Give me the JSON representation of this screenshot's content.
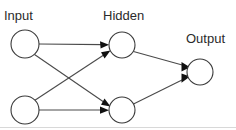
{
  "diagram": {
    "type": "neural-network",
    "title_present": false,
    "background_color": "#ffffff",
    "node_stroke_color": "#3a3a3a",
    "node_fill_color": "#ffffff",
    "edge_color": "#4a4a4a",
    "arrow_color": "#111111",
    "label_color": "#2b2b2b",
    "bottom_rule_color": "#d8d8d8",
    "labels": {
      "input": "Input",
      "hidden": "Hidden",
      "output": "Output"
    },
    "label_positions": {
      "input": {
        "x": 4,
        "y": 20
      },
      "hidden": {
        "x": 103,
        "y": 20
      },
      "output": {
        "x": 186,
        "y": 43
      }
    },
    "layers": [
      {
        "name": "input",
        "label": "Input",
        "node_count": 2,
        "nodes": [
          {
            "id": "i1",
            "cx": 25,
            "cy": 44,
            "r": 14
          },
          {
            "id": "i2",
            "cx": 25,
            "cy": 110,
            "r": 14
          }
        ]
      },
      {
        "name": "hidden",
        "label": "Hidden",
        "node_count": 2,
        "nodes": [
          {
            "id": "h1",
            "cx": 122,
            "cy": 45,
            "r": 13
          },
          {
            "id": "h2",
            "cx": 122,
            "cy": 110,
            "r": 13
          }
        ]
      },
      {
        "name": "output",
        "label": "Output",
        "node_count": 1,
        "nodes": [
          {
            "id": "o1",
            "cx": 200,
            "cy": 72,
            "r": 13
          }
        ]
      }
    ],
    "edges": [
      {
        "id": "e1",
        "from": "i1",
        "to": "h1",
        "directed": true
      },
      {
        "id": "e2",
        "from": "i1",
        "to": "h2",
        "directed": true
      },
      {
        "id": "e3",
        "from": "i2",
        "to": "h1",
        "directed": true
      },
      {
        "id": "e4",
        "from": "i2",
        "to": "h2",
        "directed": true
      },
      {
        "id": "e5",
        "from": "h1",
        "to": "o1",
        "directed": true
      },
      {
        "id": "e6",
        "from": "h2",
        "to": "o1",
        "directed": true
      }
    ],
    "edge_count": 6,
    "node_count": 5
  }
}
